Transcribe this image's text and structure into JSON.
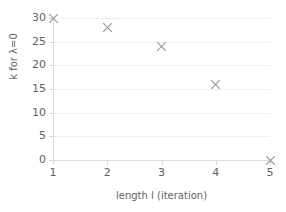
{
  "chart_data": {
    "type": "scatter",
    "title": "",
    "xlabel": "length l (iteration)",
    "ylabel": "k for λ=0",
    "x": [
      1,
      2,
      3,
      4,
      5
    ],
    "values": [
      30,
      28,
      24,
      16,
      0
    ],
    "series": [
      {
        "name": "k for λ=0",
        "x": [
          1,
          2,
          3,
          4,
          5
        ],
        "values": [
          30,
          28,
          24,
          16,
          0
        ],
        "marker": "x",
        "color": "#999999"
      }
    ],
    "xlim": [
      1,
      5
    ],
    "ylim": [
      0,
      30
    ],
    "xticks": [
      1,
      2,
      3,
      4,
      5
    ],
    "xtick_labels": [
      "1",
      "2",
      "3",
      "4",
      "5"
    ],
    "yticks": [
      0,
      5,
      10,
      15,
      20,
      25,
      30
    ],
    "ytick_labels": [
      "0",
      "5",
      "10",
      "15",
      "20",
      "25",
      "30"
    ],
    "grid": "horizontal",
    "grid_color": "#eceef0",
    "legend": "none",
    "background": "#ffffff",
    "axis_color": "#dcdfe2",
    "text_color": "#5f6368"
  }
}
